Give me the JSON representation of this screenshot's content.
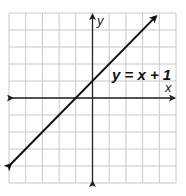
{
  "chart_data": {
    "type": "line",
    "title": "",
    "xlabel": "x",
    "ylabel": "y",
    "xlim": [
      -5,
      5
    ],
    "ylim": [
      -5,
      5
    ],
    "grid": true,
    "grid_step": 1,
    "tick_labels": false,
    "series": [
      {
        "name": "y = x + 1",
        "equation": "y = x + 1",
        "slope": 1,
        "intercept": 1,
        "x": [
          -4.9,
          3.8
        ],
        "y": [
          -3.9,
          4.8
        ],
        "arrows": "both"
      }
    ],
    "annotations": [
      {
        "text": "y = x + 1",
        "x": 1.3,
        "y": 1.5
      }
    ],
    "legend": null
  },
  "labels": {
    "x_axis": "x",
    "y_axis": "y",
    "equation": "y = x + 1"
  },
  "colors": {
    "grid": "#c8c8c8",
    "axis": "#222222",
    "line": "#111111",
    "background": "#ffffff"
  }
}
